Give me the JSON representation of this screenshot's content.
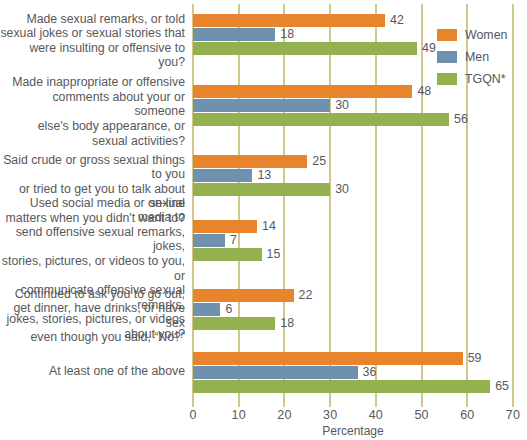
{
  "chart_data": {
    "type": "bar",
    "orientation": "horizontal",
    "title": "",
    "xlabel": "Percentage",
    "ylabel": "",
    "xlim": [
      0,
      70
    ],
    "xticks": [
      0,
      10,
      20,
      30,
      40,
      50,
      60,
      70
    ],
    "grid": true,
    "legend_position": "right",
    "categories": [
      "Made sexual remarks, or told sexual jokes or sexual stories that were insulting or offensive to you?",
      "Made inappropriate or offensive comments about your or someone else's body appearance, or sexual activities?",
      "Said crude or gross sexual things to you or tried to get you to talk about sexual matters when you didn't want to?",
      "Used social media or on-line media to send offensive sexual remarks, jokes, stories, pictures, or videos to you, or communicate offensive sexual remarks, jokes, stories, pictures, or videos about you?",
      "Continued to ask you to go out, get dinner, have drinks, or have sex even though you said, “No?”",
      "At least one of the above"
    ],
    "category_lines": [
      [
        "Made sexual remarks, or told",
        "sexual jokes or sexual stories that",
        "were insulting or offensive to you?"
      ],
      [
        "Made inappropriate or offensive",
        "comments about your or someone",
        "else's body appearance, or",
        "sexual activities?"
      ],
      [
        "Said crude or gross sexual things to you",
        "or tried to get you to talk about sexual",
        "matters when you didn't want to?"
      ],
      [
        "Used social media or on-line media to",
        "send offensive sexual remarks, jokes,",
        "stories, pictures, or videos to you, or",
        "communicate offensive sexual remarks,",
        "jokes, stories, pictures, or videos",
        "about you?"
      ],
      [
        "Continued to ask you to go out,",
        "get dinner, have drinks, or have sex",
        "even though you said, “No?”"
      ],
      [
        "At least one of the above"
      ]
    ],
    "series": [
      {
        "name": "Women",
        "color": "#e8842c",
        "values": [
          42,
          48,
          25,
          14,
          22,
          59
        ]
      },
      {
        "name": "Men",
        "color": "#6f91ad",
        "values": [
          18,
          30,
          13,
          7,
          6,
          36
        ]
      },
      {
        "name": "TGQN*",
        "color": "#93b14f",
        "values": [
          49,
          56,
          30,
          15,
          18,
          65
        ]
      }
    ]
  },
  "legend": {
    "items": [
      {
        "label": "Women",
        "color": "#e8842c"
      },
      {
        "label": "Men",
        "color": "#6f91ad"
      },
      {
        "label": "TGQN*",
        "color": "#93b14f"
      }
    ]
  },
  "axis": {
    "x_title": "Percentage",
    "x_ticks": [
      "0",
      "10",
      "20",
      "30",
      "40",
      "50",
      "60",
      "70"
    ]
  },
  "colors": {
    "women": "#e8842c",
    "men": "#6f91ad",
    "tgqn": "#93b14f",
    "grid": "#cfc88a",
    "text": "#58585a",
    "background": "#ffffff"
  }
}
